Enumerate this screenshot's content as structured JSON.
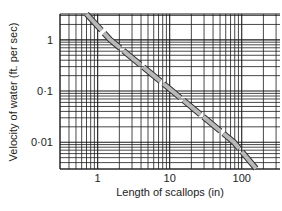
{
  "chart_data": {
    "type": "line",
    "title": "",
    "xlabel": "Length of scallops (in)",
    "ylabel": "Velocity of water (ft. per sec)",
    "xscale": "log",
    "yscale": "log",
    "xlim": [
      0.3,
      340
    ],
    "ylim": [
      0.003,
      3.2
    ],
    "x_ticks": [
      {
        "value": 1,
        "label": "1"
      },
      {
        "value": 10,
        "label": "10"
      },
      {
        "value": 100,
        "label": "100"
      }
    ],
    "y_ticks": [
      {
        "value": 1,
        "label": "1"
      },
      {
        "value": 0.1,
        "label": "0·1"
      },
      {
        "value": 0.01,
        "label": "0·01"
      }
    ],
    "grid": true,
    "legend": null,
    "series": [
      {
        "name": "scallop length vs flow velocity",
        "style": "dashed grey band",
        "x": [
          0.7,
          1.5,
          10,
          78,
          160
        ],
        "y": [
          3.2,
          1.0,
          0.11,
          0.01,
          0.003
        ]
      }
    ]
  },
  "colors": {
    "grid": "#1a1a1a",
    "line_fill": "#b8b8b8",
    "line_edge": "#333333",
    "background": "#ffffff"
  }
}
